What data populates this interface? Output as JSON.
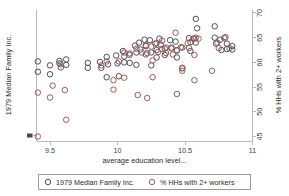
{
  "chart_data": {
    "type": "scatter",
    "title": "",
    "xlabel": "average education level...",
    "ylabel_left": "1979 Median Family Inc.",
    "ylabel_right": "% HHs with 2+ workers",
    "xlim": [
      9.4,
      11.0
    ],
    "ylim": [
      44.0,
      70.6
    ],
    "xticks": [
      9.5,
      10,
      10.5,
      11
    ],
    "xticklabels": [
      "9.5",
      "10",
      "10.5",
      "11"
    ],
    "right_yticks": [
      45,
      50,
      55,
      60,
      65,
      70
    ],
    "right_yticklabels": [
      "45",
      "50",
      "55",
      "60",
      "65",
      "70"
    ],
    "left_yticks": [],
    "left_yticklabels": [],
    "grid": false,
    "legend_position": "below-axes",
    "marker": "open-circle",
    "series": [
      {
        "name": "1979 Median Family Inc.",
        "color": "#4e4e61",
        "points": [
          [
            9.41,
            60.2
          ],
          [
            9.41,
            58.1
          ],
          [
            9.5,
            59.4
          ],
          [
            9.5,
            57.6
          ],
          [
            9.57,
            59.8
          ],
          [
            9.58,
            59.0
          ],
          [
            9.57,
            60.3
          ],
          [
            9.62,
            60.6
          ],
          [
            9.62,
            59.5
          ],
          [
            9.78,
            59.9
          ],
          [
            9.78,
            58.9
          ],
          [
            9.87,
            60.1
          ],
          [
            9.88,
            58.9
          ],
          [
            9.92,
            61.1
          ],
          [
            9.93,
            59.6
          ],
          [
            9.92,
            57.0
          ],
          [
            9.99,
            61.4
          ],
          [
            10.0,
            59.8
          ],
          [
            10.01,
            57.2
          ],
          [
            10.04,
            62.3
          ],
          [
            10.05,
            61.2
          ],
          [
            10.05,
            60.0
          ],
          [
            10.09,
            61.8
          ],
          [
            10.09,
            59.9
          ],
          [
            10.13,
            63.4
          ],
          [
            10.14,
            62.0
          ],
          [
            10.14,
            59.5
          ],
          [
            10.16,
            64.0
          ],
          [
            10.17,
            62.6
          ],
          [
            10.2,
            64.6
          ],
          [
            10.21,
            63.3
          ],
          [
            10.21,
            61.6
          ],
          [
            10.24,
            64.5
          ],
          [
            10.25,
            62.0
          ],
          [
            10.25,
            59.4
          ],
          [
            10.28,
            63.8
          ],
          [
            10.29,
            62.5
          ],
          [
            10.29,
            61.0
          ],
          [
            10.31,
            64.8
          ],
          [
            10.32,
            63.6
          ],
          [
            10.35,
            62.8
          ],
          [
            10.35,
            61.5
          ],
          [
            10.39,
            64.5
          ],
          [
            10.4,
            63.0
          ],
          [
            10.43,
            64.2
          ],
          [
            10.44,
            62.4
          ],
          [
            10.44,
            61.0
          ],
          [
            10.48,
            63.0
          ],
          [
            10.48,
            58.8
          ],
          [
            10.53,
            64.9
          ],
          [
            10.54,
            64.1
          ],
          [
            10.54,
            62.3
          ],
          [
            10.57,
            64.8
          ],
          [
            10.58,
            64.0
          ],
          [
            10.58,
            68.8
          ],
          [
            10.59,
            66.9
          ],
          [
            10.72,
            65.0
          ],
          [
            10.73,
            63.8
          ],
          [
            10.72,
            67.3
          ],
          [
            10.76,
            64.6
          ],
          [
            10.77,
            62.5
          ],
          [
            10.8,
            65.1
          ],
          [
            10.81,
            63.8
          ],
          [
            10.81,
            62.7
          ],
          [
            10.85,
            63.3
          ],
          [
            10.85,
            62.6
          ]
        ]
      },
      {
        "name": "% HHs with 2+ workers",
        "color": "#a15a50",
        "points": [
          [
            9.41,
            53.9
          ],
          [
            9.41,
            45.0
          ],
          [
            9.5,
            52.9
          ],
          [
            9.52,
            55.3
          ],
          [
            9.58,
            59.6
          ],
          [
            9.61,
            54.4
          ],
          [
            9.62,
            48.4
          ],
          [
            9.88,
            59.4
          ],
          [
            9.92,
            60.2
          ],
          [
            9.97,
            56.4
          ],
          [
            9.97,
            54.5
          ],
          [
            10.01,
            60.2
          ],
          [
            10.05,
            62.0
          ],
          [
            10.05,
            56.9
          ],
          [
            10.09,
            61.5
          ],
          [
            10.14,
            62.8
          ],
          [
            10.15,
            53.4
          ],
          [
            10.18,
            62.0
          ],
          [
            10.21,
            63.5
          ],
          [
            10.22,
            61.9
          ],
          [
            10.22,
            52.8
          ],
          [
            10.25,
            63.2
          ],
          [
            10.26,
            60.4
          ],
          [
            10.26,
            57.0
          ],
          [
            10.29,
            63.9
          ],
          [
            10.3,
            62.1
          ],
          [
            10.33,
            64.4
          ],
          [
            10.33,
            62.7
          ],
          [
            10.36,
            63.0
          ],
          [
            10.36,
            61.9
          ],
          [
            10.4,
            62.8
          ],
          [
            10.41,
            61.6
          ],
          [
            10.43,
            66.0
          ],
          [
            10.44,
            62.5
          ],
          [
            10.44,
            53.6
          ],
          [
            10.47,
            63.1
          ],
          [
            10.48,
            58.9
          ],
          [
            10.48,
            58.3
          ],
          [
            10.52,
            63.9
          ],
          [
            10.53,
            62.9
          ],
          [
            10.56,
            64.8
          ],
          [
            10.57,
            61.5
          ],
          [
            10.57,
            56.4
          ],
          [
            10.58,
            65.0
          ],
          [
            10.6,
            64.8
          ],
          [
            10.7,
            58.3
          ],
          [
            10.74,
            64.0
          ],
          [
            10.75,
            62.9
          ],
          [
            10.79,
            64.9
          ],
          [
            10.83,
            62.9
          ]
        ]
      }
    ]
  },
  "legend": {
    "entries": [
      {
        "label": "1979 Median Family Inc.",
        "marker": "open-circle",
        "color": "#4e4e61"
      },
      {
        "label": "% HHs with 2+ workers",
        "marker": "open-circle",
        "color": "#a15a50"
      }
    ]
  },
  "axes": {
    "x_title": "average education level...",
    "left_y_title": "1979 Median Family Inc.",
    "right_y_title": "% HHs with 2+ workers"
  },
  "colors": {
    "series_1": "#4e4e61",
    "series_2": "#a15a50",
    "axis": "#b9b9b9",
    "text": "#2b2b2b",
    "background": "#ffffff"
  }
}
